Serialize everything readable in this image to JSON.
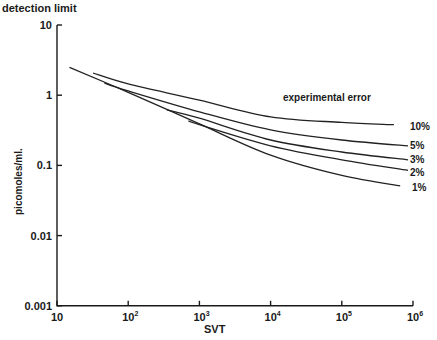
{
  "chart_data": {
    "type": "line",
    "title": "detection   limit",
    "xlabel": "SVT",
    "ylabel": "picomoles/ml.",
    "x_scale": "log",
    "y_scale": "log",
    "xlim": [
      10,
      1000000
    ],
    "ylim": [
      0.001,
      10
    ],
    "grid": false,
    "legend_position": "right, inline labels at curve ends",
    "annotation": "experimental   error",
    "x_ticks": [
      {
        "value": 10,
        "label": "10"
      },
      {
        "value": 100,
        "label": "10",
        "exp": "2"
      },
      {
        "value": 1000,
        "label": "10",
        "exp": "3"
      },
      {
        "value": 10000,
        "label": "10",
        "exp": "4"
      },
      {
        "value": 100000,
        "label": "10",
        "exp": "5"
      },
      {
        "value": 1000000,
        "label": "10",
        "exp": "6"
      }
    ],
    "y_ticks": [
      {
        "value": 10,
        "label": "10"
      },
      {
        "value": 1,
        "label": "1"
      },
      {
        "value": 0.1,
        "label": "0.1"
      },
      {
        "value": 0.01,
        "label": "0.01"
      },
      {
        "value": 0.001,
        "label": "0.001"
      }
    ],
    "series": [
      {
        "name": "10%",
        "x": [
          32,
          100,
          1000,
          10000,
          100000,
          540000
        ],
        "values": [
          2.07,
          1.45,
          0.85,
          0.49,
          0.41,
          0.38
        ]
      },
      {
        "name": "5%",
        "x": [
          46,
          100,
          1000,
          10000,
          100000,
          850000
        ],
        "values": [
          1.49,
          1.15,
          0.58,
          0.32,
          0.23,
          0.19
        ]
      },
      {
        "name": "3%",
        "x": [
          350,
          1000,
          10000,
          100000,
          850000
        ],
        "values": [
          0.62,
          0.47,
          0.23,
          0.155,
          0.12
        ]
      },
      {
        "name": "2%",
        "x": [
          700,
          1000,
          10000,
          100000,
          850000
        ],
        "values": [
          0.43,
          0.38,
          0.19,
          0.12,
          0.085
        ]
      },
      {
        "name": "1%",
        "x": [
          15,
          100,
          1000,
          10000,
          100000,
          660000
        ],
        "values": [
          2.5,
          1.1,
          0.39,
          0.14,
          0.072,
          0.051
        ]
      }
    ]
  },
  "labels": {
    "title": "detection   limit",
    "ylabel": "picomoles/ml.",
    "xlabel": "SVT",
    "annotation": "experimental   error",
    "series_10": "10%",
    "series_5": "5%",
    "series_3": "3%",
    "series_2": "2%",
    "series_1": "1%"
  }
}
